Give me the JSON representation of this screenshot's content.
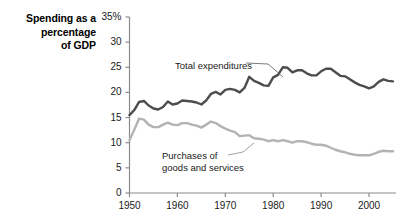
{
  "chart_data": {
    "type": "line",
    "title": "Spending as a percentage of GDP",
    "title_lines": [
      "Spending as a",
      "percentage",
      "of GDP"
    ],
    "xlabel": "",
    "ylabel": "Spending as a percentage of GDP",
    "xlim": [
      1950,
      2005
    ],
    "ylim": [
      0,
      35
    ],
    "grid": false,
    "legend_position": "inline-annotations",
    "y_ticks": [
      0,
      5,
      10,
      15,
      20,
      25,
      30,
      35
    ],
    "y_tick_labels": [
      "0",
      "5",
      "10",
      "15",
      "20",
      "25",
      "30",
      "35%"
    ],
    "x_ticks": [
      1950,
      1960,
      1970,
      1980,
      1990,
      2000
    ],
    "x_tick_labels": [
      "1950",
      "1960",
      "1970",
      "1980",
      "1990",
      "2000"
    ],
    "colors": {
      "total_expenditures": "#4d4d4d",
      "purchases": "#b3b3b3",
      "axis": "#808080",
      "text": "#1a1a1a"
    },
    "x": [
      1950,
      1951,
      1952,
      1953,
      1954,
      1955,
      1956,
      1957,
      1958,
      1959,
      1960,
      1961,
      1962,
      1963,
      1964,
      1965,
      1966,
      1967,
      1968,
      1969,
      1970,
      1971,
      1972,
      1973,
      1974,
      1975,
      1976,
      1977,
      1978,
      1979,
      1980,
      1981,
      1982,
      1983,
      1984,
      1985,
      1986,
      1987,
      1988,
      1989,
      1990,
      1991,
      1992,
      1993,
      1994,
      1995,
      1996,
      1997,
      1998,
      1999,
      2000,
      2001,
      2002,
      2003,
      2004,
      2005
    ],
    "series": [
      {
        "name": "Total expenditures",
        "color": "#4d4d4d",
        "values": [
          15.5,
          16.5,
          18.1,
          18.3,
          17.4,
          16.8,
          16.6,
          17.1,
          18.2,
          17.6,
          17.8,
          18.4,
          18.3,
          18.2,
          18.0,
          17.6,
          18.4,
          19.7,
          20.1,
          19.6,
          20.5,
          20.7,
          20.5,
          20.0,
          20.9,
          23.1,
          22.3,
          21.9,
          21.4,
          21.3,
          23.0,
          23.5,
          25.0,
          24.9,
          24.0,
          24.4,
          24.4,
          23.8,
          23.4,
          23.4,
          24.2,
          24.7,
          24.7,
          24.0,
          23.3,
          23.2,
          22.6,
          22.0,
          21.5,
          21.2,
          20.8,
          21.2,
          22.1,
          22.6,
          22.3,
          22.2
        ]
      },
      {
        "name": "Purchases of goods and services",
        "color": "#b3b3b3",
        "values": [
          10.5,
          12.6,
          14.8,
          14.6,
          13.6,
          13.1,
          13.1,
          13.6,
          14.0,
          13.6,
          13.5,
          13.9,
          13.9,
          13.6,
          13.4,
          13.0,
          13.6,
          14.2,
          13.9,
          13.3,
          12.8,
          12.4,
          12.1,
          11.3,
          11.4,
          11.5,
          10.9,
          10.8,
          10.6,
          10.3,
          10.5,
          10.3,
          10.5,
          10.3,
          10.0,
          10.3,
          10.3,
          10.1,
          9.8,
          9.6,
          9.6,
          9.4,
          9.0,
          8.6,
          8.3,
          8.1,
          7.8,
          7.6,
          7.5,
          7.5,
          7.5,
          7.8,
          8.2,
          8.4,
          8.3,
          8.3
        ]
      }
    ],
    "annotations": [
      {
        "text": "Total expenditures",
        "target_year": 1978,
        "target_value": 21.4
      },
      {
        "text_lines": [
          "Purchases of",
          "goods and services"
        ],
        "target_year": 1974,
        "target_value": 11.4
      }
    ]
  }
}
